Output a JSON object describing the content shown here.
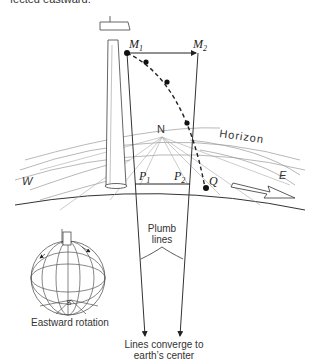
{
  "caption_top_cut": "fected eastward.",
  "labels": {
    "M1": "M",
    "M1_sub": "1",
    "M2": "M",
    "M2_sub": "2",
    "N": "N",
    "horizon": "Horizon",
    "W": "W",
    "E": "E",
    "P1": "P",
    "P1_sub": "1",
    "P2": "P",
    "P2_sub": "2",
    "Q": "Q",
    "S": "S",
    "plumb_line1": "Plumb",
    "plumb_line2": "lines",
    "eastward_rotation": "Eastward rotation",
    "converge_line1": "Lines converge to",
    "converge_line2": "earth’s center"
  },
  "colors": {
    "ink": "#222222",
    "light_ink": "#888888",
    "background": "#ffffff"
  }
}
